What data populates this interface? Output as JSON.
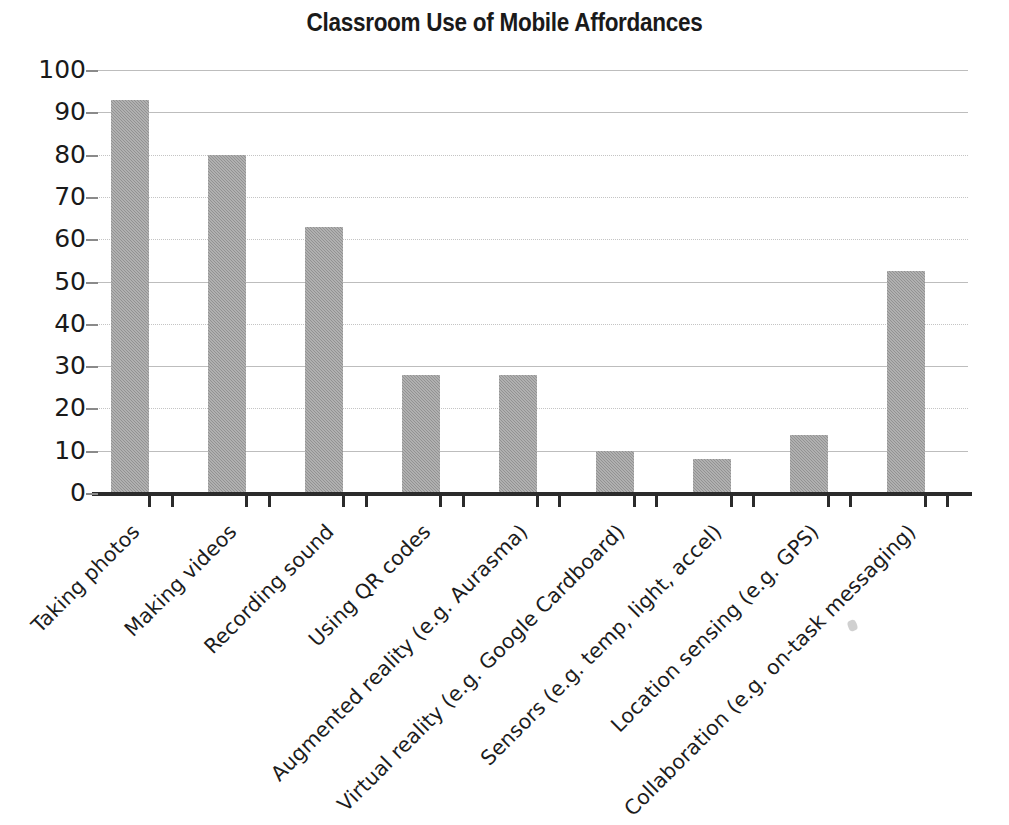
{
  "chart_data": {
    "type": "bar",
    "title": "Classroom Use of Mobile Affordances",
    "xlabel": "",
    "ylabel": "",
    "ylim": [
      0,
      100
    ],
    "ytick_values": [
      0,
      10,
      20,
      30,
      40,
      50,
      60,
      70,
      80,
      90,
      100
    ],
    "ytick_labels": [
      "0",
      "10",
      "20",
      "30",
      "40",
      "50",
      "60",
      "70",
      "80",
      "90",
      "100"
    ],
    "grid": true,
    "legend": false,
    "bar_color": "#9a9a9a",
    "categories": [
      "Taking photos",
      "Making videos",
      "Recording sound",
      "Using QR codes",
      "Augmented reality (e.g. Aurasma)",
      "Virtual reality (e.g. Google Cardboard)",
      "Sensors (e.g. temp, light, accel)",
      "Location sensing (e.g. GPS)",
      "Collaboration (e.g. on-task messaging)"
    ],
    "values": [
      93,
      80,
      63,
      27.8,
      27.8,
      10,
      8,
      13.7,
      52.5
    ]
  }
}
